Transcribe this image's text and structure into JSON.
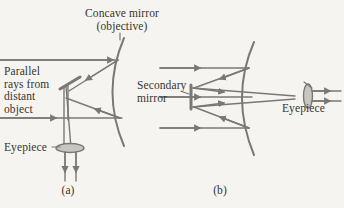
{
  "figure": {
    "background_color": "#f6f4f0",
    "ink_color": "#7b7874",
    "text_color": "#37352f",
    "title": "Concave mirror\n(objective)",
    "labels": {
      "parallel_rays": "Parallel\nrays from\ndistant\nobject",
      "eyepiece_a": "Eyepiece",
      "secondary_mirror": "Secondary\nmirror",
      "eyepiece_b": "Eyepiece"
    },
    "captions": {
      "a": "(a)",
      "b": "(b)"
    },
    "panels": [
      {
        "id": "a",
        "caption": "(a)",
        "type": "newtonian-reflector",
        "components": [
          "concave mirror (objective)",
          "flat diagonal secondary mirror",
          "eyepiece lens",
          "incoming parallel rays",
          "optical axis"
        ]
      },
      {
        "id": "b",
        "caption": "(b)",
        "type": "cassegrain-reflector",
        "components": [
          "concave mirror (objective)",
          "secondary mirror",
          "eyepiece lens",
          "incoming parallel rays",
          "optical axis"
        ]
      }
    ]
  }
}
